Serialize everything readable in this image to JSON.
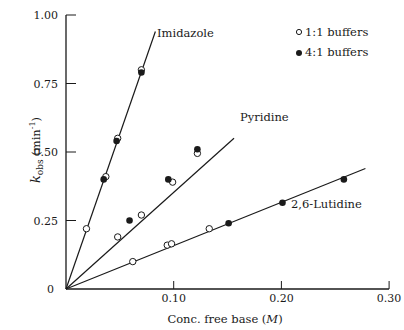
{
  "chart_data": {
    "type": "scatter",
    "title": "",
    "xlabel": "Conc. free base (M)",
    "ylabel": "k_obs (min^-1)",
    "xlim": [
      0,
      0.3
    ],
    "ylim": [
      0,
      1.0
    ],
    "x_ticks": [
      "0.10",
      "0.20",
      "0.30"
    ],
    "x_tick_values": [
      0.1,
      0.2,
      0.3
    ],
    "y_ticks": [
      "0",
      "0.25",
      "0.50",
      "0.75",
      "1.00"
    ],
    "y_tick_values": [
      0,
      0.25,
      0.5,
      0.75,
      1.0
    ],
    "grid": false,
    "legend": {
      "position": "upper right",
      "entries": [
        {
          "label": "1:1 buffers",
          "marker": "open-circle"
        },
        {
          "label": "4:1 buffers",
          "marker": "filled-circle"
        }
      ]
    },
    "series": [
      {
        "name": "Imidazole",
        "fit_line": {
          "x": [
            0,
            0.083
          ],
          "y": [
            0,
            0.94
          ]
        },
        "open_points": {
          "x": [
            0.019,
            0.037,
            0.048,
            0.07
          ],
          "y": [
            0.22,
            0.41,
            0.55,
            0.8
          ]
        },
        "filled_points": {
          "x": [
            0.035,
            0.047,
            0.07
          ],
          "y": [
            0.4,
            0.54,
            0.79
          ]
        }
      },
      {
        "name": "Pyridine",
        "fit_line": {
          "x": [
            0,
            0.156
          ],
          "y": [
            0,
            0.55
          ]
        },
        "open_points": {
          "x": [
            0.048,
            0.07,
            0.099,
            0.122
          ],
          "y": [
            0.19,
            0.27,
            0.39,
            0.495
          ]
        },
        "filled_points": {
          "x": [
            0.059,
            0.095,
            0.122
          ],
          "y": [
            0.25,
            0.4,
            0.51
          ]
        }
      },
      {
        "name": "2,6-Lutidine",
        "fit_line": {
          "x": [
            0,
            0.278
          ],
          "y": [
            0,
            0.44
          ]
        },
        "open_points": {
          "x": [
            0.062,
            0.094,
            0.098,
            0.133
          ],
          "y": [
            0.1,
            0.16,
            0.165,
            0.22
          ]
        },
        "filled_points": {
          "x": [
            0.151,
            0.201,
            0.258
          ],
          "y": [
            0.24,
            0.315,
            0.4
          ]
        }
      }
    ]
  },
  "labels": {
    "imidazole": "Imidazole",
    "pyridine": "Pyridine",
    "lutidine": "2,6-Lutidine",
    "legend_open": "1:1 buffers",
    "legend_filled": "4:1 buffers",
    "y_axis_k": "k",
    "y_axis_sub": "obs",
    "y_axis_unit": "(min",
    "y_axis_exp": "-1",
    "y_axis_close": ")",
    "x_axis_main": "Conc. free base (",
    "x_axis_unit": "M",
    "x_axis_close": ")",
    "origin": "0"
  }
}
